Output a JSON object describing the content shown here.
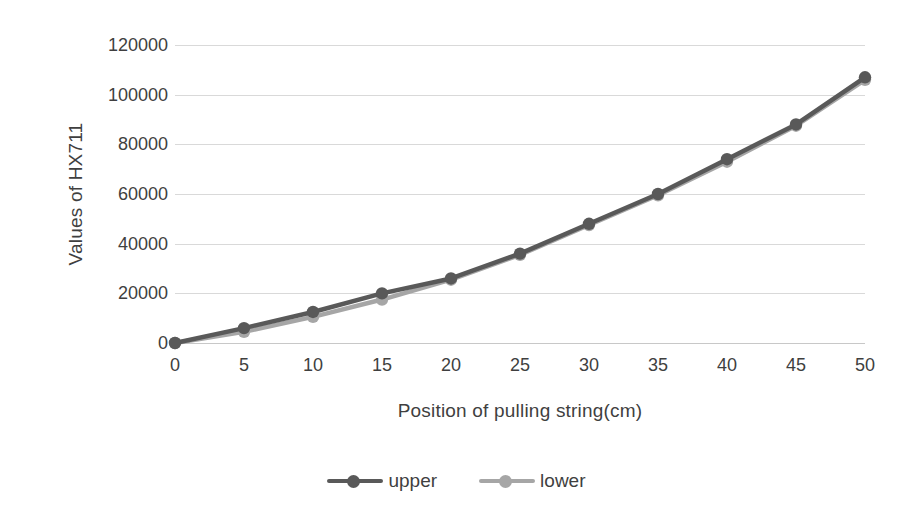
{
  "chart_data": {
    "type": "line",
    "title": "",
    "xlabel": "Position of pulling string(cm)",
    "ylabel": "Values of HX711",
    "x": [
      0,
      5,
      10,
      15,
      20,
      25,
      30,
      35,
      40,
      45,
      50
    ],
    "categories": [
      "0",
      "5",
      "10",
      "15",
      "20",
      "25",
      "30",
      "35",
      "40",
      "45",
      "50"
    ],
    "series": [
      {
        "name": "upper",
        "color": "#595959",
        "values": [
          0,
          6000,
          12500,
          20000,
          26000,
          36000,
          48000,
          60000,
          74000,
          88000,
          107000
        ]
      },
      {
        "name": "lower",
        "color": "#a6a6a6",
        "values": [
          0,
          4500,
          10500,
          17500,
          25500,
          35500,
          47500,
          59500,
          73000,
          87500,
          106000
        ]
      }
    ],
    "ylim": [
      0,
      120000
    ],
    "yticks": [
      0,
      20000,
      40000,
      60000,
      80000,
      100000,
      120000
    ],
    "ytick_labels": [
      "0",
      "20000",
      "40000",
      "60000",
      "80000",
      "100000",
      "120000"
    ],
    "xlim": [
      0,
      50
    ],
    "grid": "horizontal",
    "legend_position": "bottom",
    "marker": "circle"
  },
  "legend": {
    "items": [
      {
        "label": "upper",
        "color": "#595959"
      },
      {
        "label": "lower",
        "color": "#a6a6a6"
      }
    ]
  },
  "axes": {
    "x_title": "Position of pulling string(cm)",
    "y_title": "Values of HX711"
  },
  "colors": {
    "background": "#ffffff",
    "gridline": "#d9d9d9",
    "text": "#3f3f3f",
    "series_upper": "#595959",
    "series_lower": "#a6a6a6"
  }
}
